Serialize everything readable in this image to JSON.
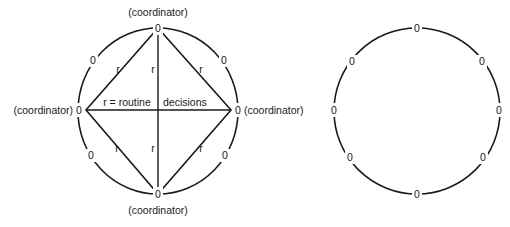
{
  "diagram": {
    "left_network": {
      "type": "circle-with-coordinators",
      "node_symbol": "0",
      "nodes": [
        {
          "id": "top",
          "label": "0",
          "role": "coordinator",
          "caption": "(coordinator)"
        },
        {
          "id": "upper-right",
          "label": "0"
        },
        {
          "id": "right",
          "label": "0",
          "role": "coordinator",
          "caption": "(coordinator)"
        },
        {
          "id": "lower-right",
          "label": "0"
        },
        {
          "id": "bottom",
          "label": "0",
          "role": "coordinator",
          "caption": "(coordinator)"
        },
        {
          "id": "lower-left",
          "label": "0"
        },
        {
          "id": "left",
          "label": "0",
          "role": "coordinator",
          "caption": "(coordinator)"
        },
        {
          "id": "upper-left",
          "label": "0"
        }
      ],
      "edge_labels": {
        "upper_left": "r",
        "upper_center": "r",
        "upper_right": "r",
        "lower_left": "r",
        "lower_center": "r",
        "lower_right": "r"
      },
      "legend_left": "r = routine",
      "legend_right": "decisions"
    },
    "right_network": {
      "type": "circle",
      "node_symbol": "0",
      "nodes": [
        {
          "id": "top",
          "label": "0"
        },
        {
          "id": "upper-right",
          "label": "0"
        },
        {
          "id": "right",
          "label": "0"
        },
        {
          "id": "lower-right",
          "label": "0"
        },
        {
          "id": "bottom",
          "label": "0"
        },
        {
          "id": "lower-left",
          "label": "0"
        },
        {
          "id": "left",
          "label": "0"
        },
        {
          "id": "upper-left",
          "label": "0"
        }
      ]
    }
  }
}
